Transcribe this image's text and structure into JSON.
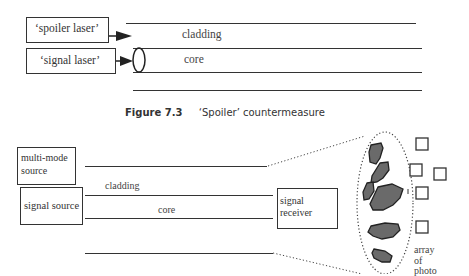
{
  "figure_top": {
    "boxes": {
      "spoiler_laser": "‘spoiler laser’",
      "signal_laser": "‘signal laser’"
    },
    "labels": {
      "cladding": "cladding",
      "core": "core"
    }
  },
  "caption": {
    "number": "Figure 7.3",
    "text": "‘Spoiler’ countermeasure"
  },
  "figure_bottom": {
    "boxes": {
      "multimode_source_line1": "multi-mode",
      "multimode_source_line2": "source",
      "signal_source": "signal source",
      "signal_receiver_line1": "signal",
      "signal_receiver_line2": "receiver"
    },
    "labels": {
      "cladding": "cladding",
      "core": "core",
      "array_line1": "array",
      "array_line2": "of",
      "array_line3": "photo"
    }
  }
}
